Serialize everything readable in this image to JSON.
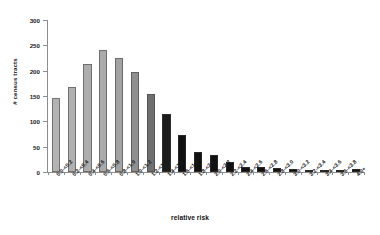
{
  "chart_data": {
    "type": "bar",
    "title": "",
    "xlabel": "relative risk",
    "ylabel": "# census tracts",
    "ylim": [
      0,
      300
    ],
    "yticks": [
      0,
      50,
      100,
      150,
      200,
      250,
      300
    ],
    "grid": false,
    "legend": null,
    "categories": [
      "0.0-<0.2",
      "0.2-<0.4",
      "0.4-<0.6",
      "0.6-<0.8",
      "0.8-<1.0",
      "1.0-<1.2",
      "1.2-<1.4",
      "1.4-<1.6",
      "1.6-<1.8",
      "1.8-<2.0",
      "2.0-<2.2",
      "2.2-<2.4",
      "2.4-<2.6",
      "2.6-<2.8",
      "2.8-<3.0",
      "3.0-<3.2",
      "3.2-<3.4",
      "3.4-<3.6",
      "3.6-<3.8",
      "4.0+"
    ],
    "values": [
      147,
      168,
      213,
      240,
      225,
      197,
      153,
      114,
      73,
      40,
      33,
      19,
      10,
      9,
      7,
      6,
      2,
      2,
      1,
      6
    ],
    "bar_colors": [
      "#b3b3b3",
      "#b0b0b0",
      "#adadad",
      "#aaaaaa",
      "#a3a3a3",
      "#8f8f8f",
      "#6f6f6f",
      "#1c1c1c",
      "#111111",
      "#111111",
      "#111111",
      "#111111",
      "#111111",
      "#111111",
      "#111111",
      "#111111",
      "#111111",
      "#111111",
      "#111111",
      "#111111"
    ]
  },
  "axis": {
    "line_color": "#8d8d8d",
    "text_color": "#1a1a1a"
  }
}
